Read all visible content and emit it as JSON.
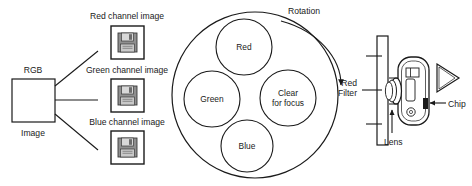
{
  "diagram": {
    "stroke_color": "#1a1a1a",
    "background": "#ffffff",
    "icon_fill": "#9a9a9a"
  },
  "source": {
    "box_top_label": "RGB",
    "box_bottom_label": "Image",
    "channels": [
      {
        "label": "Red channel image",
        "icon": "floppy-disk-icon"
      },
      {
        "label": "Green channel image",
        "icon": "floppy-disk-icon"
      },
      {
        "label": "Blue channel image",
        "icon": "floppy-disk-icon"
      }
    ]
  },
  "filter_wheel": {
    "rotation_label": "Rotation",
    "rotation_direction": "clockwise",
    "filters": [
      {
        "label": "Red",
        "position": "top"
      },
      {
        "label": "Green",
        "position": "left"
      },
      {
        "label": "Clear for focus",
        "line1": "Clear",
        "line2": "for focus",
        "position": "right"
      },
      {
        "label": "Blue",
        "position": "bottom"
      }
    ]
  },
  "camera": {
    "filter_label_line1": "Red",
    "filter_label_line2": "Filter",
    "lens_label": "Lens",
    "chip_label": "Chip",
    "parts": [
      {
        "name": "filter-plate"
      },
      {
        "name": "lens-barrel"
      },
      {
        "name": "camera-body"
      },
      {
        "name": "ccd-chip"
      },
      {
        "name": "viewfinder-cone"
      }
    ]
  }
}
